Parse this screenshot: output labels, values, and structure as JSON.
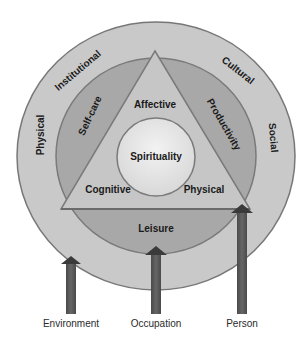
{
  "diagram": {
    "outer_ring": {
      "name": "Environment",
      "labels": [
        "Physical",
        "Institutional",
        "Cultural",
        "Social"
      ],
      "color": "#c9c9c9"
    },
    "middle_ring": {
      "name": "Occupation",
      "labels": [
        "Self-care",
        "Productivity",
        "Leisure"
      ],
      "color": "#a8a8a8"
    },
    "triangle": {
      "name": "Person",
      "labels": [
        "Affective",
        "Cognitive",
        "Physical"
      ],
      "color": "#c6c6c6"
    },
    "core": {
      "label": "Spirituality",
      "color": "#e6e6e6"
    },
    "arrows": [
      {
        "label": "Environment",
        "color": "#545454"
      },
      {
        "label": "Occupation",
        "color": "#545454"
      },
      {
        "label": "Person",
        "color": "#545454"
      }
    ]
  }
}
